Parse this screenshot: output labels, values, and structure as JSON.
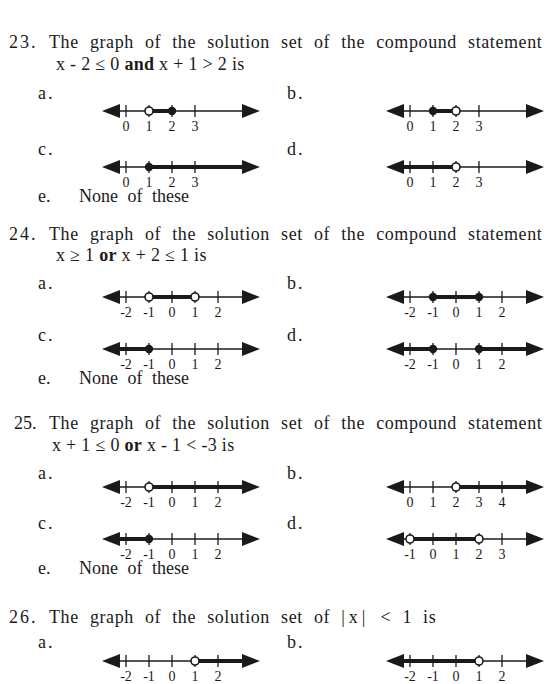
{
  "questions": [
    {
      "number": "23.",
      "line1": "The graph of the solution set of the compound statement",
      "line2_parts": [
        "x - 2 ≤ 0 ",
        "and",
        " x + 1 > 2 is"
      ],
      "options": {
        "a": {
          "label": "a.",
          "ticks": [
            "0",
            "1",
            "2",
            "3"
          ],
          "tick_values": [
            0,
            1,
            2,
            3
          ],
          "points": [
            {
              "x": 1,
              "type": "open"
            },
            {
              "x": 2,
              "type": "closed"
            }
          ],
          "shaded": [
            [
              1,
              2
            ]
          ]
        },
        "b": {
          "label": "b.",
          "ticks": [
            "0",
            "1",
            "2",
            "3"
          ],
          "tick_values": [
            0,
            1,
            2,
            3
          ],
          "points": [
            {
              "x": 1,
              "type": "closed"
            },
            {
              "x": 2,
              "type": "open"
            }
          ],
          "shaded": [
            [
              1,
              2
            ]
          ]
        },
        "c": {
          "label": "c.",
          "ticks": [
            "0",
            "1",
            "2",
            "3"
          ],
          "tick_values": [
            0,
            1,
            2,
            3
          ],
          "points": [
            {
              "x": 1,
              "type": "closed"
            }
          ],
          "shaded": [
            [
              1,
              "inf"
            ]
          ]
        },
        "d": {
          "label": "d.",
          "ticks": [
            "0",
            "1",
            "2",
            "3"
          ],
          "tick_values": [
            0,
            1,
            2,
            3
          ],
          "points": [
            {
              "x": 2,
              "type": "open"
            }
          ],
          "shaded": [
            [
              "-inf",
              2
            ]
          ]
        },
        "e": {
          "label": "e.",
          "text": "None of these"
        }
      }
    },
    {
      "number": "24.",
      "line1": "The graph of the solution set of the compound statement",
      "line2_parts": [
        "x ≥ 1 ",
        "or",
        " x + 2 ≤ 1 is"
      ],
      "options": {
        "a": {
          "label": "a.",
          "ticks": [
            "-2",
            "-1",
            "0",
            "1",
            "2"
          ],
          "tick_values": [
            -2,
            -1,
            0,
            1,
            2
          ],
          "points": [
            {
              "x": -1,
              "type": "open"
            },
            {
              "x": 1,
              "type": "open"
            }
          ],
          "shaded": [
            [
              -1,
              1
            ]
          ]
        },
        "b": {
          "label": "b.",
          "ticks": [
            "-2",
            "-1",
            "0",
            "1",
            "2"
          ],
          "tick_values": [
            -2,
            -1,
            0,
            1,
            2
          ],
          "points": [
            {
              "x": -1,
              "type": "closed"
            },
            {
              "x": 1,
              "type": "closed"
            }
          ],
          "shaded": [
            [
              -1,
              1
            ]
          ]
        },
        "c": {
          "label": "c.",
          "ticks": [
            "-2",
            "-1",
            "0",
            "1",
            "2"
          ],
          "tick_values": [
            -2,
            -1,
            0,
            1,
            2
          ],
          "points": [
            {
              "x": -1,
              "type": "closed"
            }
          ],
          "shaded": [
            [
              "-inf",
              -1
            ]
          ]
        },
        "d": {
          "label": "d.",
          "ticks": [
            "-2",
            "-1",
            "0",
            "1",
            "2"
          ],
          "tick_values": [
            -2,
            -1,
            0,
            1,
            2
          ],
          "points": [
            {
              "x": -1,
              "type": "closed"
            },
            {
              "x": 1,
              "type": "closed"
            }
          ],
          "shaded": [
            [
              "-inf",
              -1
            ],
            [
              1,
              "inf"
            ]
          ]
        },
        "e": {
          "label": "e.",
          "text": "None of these"
        }
      }
    },
    {
      "number": "25.",
      "line1": "The graph of the solution set of the compound statement",
      "line2_parts": [
        "x + 1 ≤ 0 ",
        "or",
        " x - 1 < -3 is"
      ],
      "options": {
        "a": {
          "label": "a.",
          "ticks": [
            "-2",
            "-1",
            "0",
            "1",
            "2"
          ],
          "tick_values": [
            -2,
            -1,
            0,
            1,
            2
          ],
          "points": [
            {
              "x": -1,
              "type": "open"
            }
          ],
          "shaded": [
            [
              -1,
              "inf"
            ]
          ]
        },
        "b": {
          "label": "b.",
          "ticks": [
            "0",
            "1",
            "2",
            "3",
            "4"
          ],
          "tick_values": [
            0,
            1,
            2,
            3,
            4
          ],
          "points": [
            {
              "x": 2,
              "type": "open"
            }
          ],
          "shaded": [
            [
              2,
              "inf"
            ]
          ]
        },
        "c": {
          "label": "c.",
          "ticks": [
            "-2",
            "-1",
            "0",
            "1",
            "2"
          ],
          "tick_values": [
            -2,
            -1,
            0,
            1,
            2
          ],
          "points": [
            {
              "x": -1,
              "type": "closed"
            }
          ],
          "shaded": [
            [
              "-inf",
              -1
            ]
          ]
        },
        "d": {
          "label": "d.",
          "ticks": [
            "-1",
            "0",
            "1",
            "2",
            "3"
          ],
          "tick_values": [
            -1,
            0,
            1,
            2,
            3
          ],
          "points": [
            {
              "x": -1,
              "type": "open"
            },
            {
              "x": 2,
              "type": "open"
            }
          ],
          "shaded": [
            [
              -1,
              2
            ]
          ]
        },
        "e": {
          "label": "e.",
          "text": "None of these"
        }
      }
    },
    {
      "number": "26.",
      "line1_parts": [
        "The graph of the solution set of ",
        "|x|",
        " < 1 is"
      ],
      "options": {
        "a": {
          "label": "a.",
          "ticks": [
            "-2",
            "-1",
            "0",
            "1",
            "2"
          ],
          "tick_values": [
            -2,
            -1,
            0,
            1,
            2
          ],
          "points": [
            {
              "x": 1,
              "type": "open"
            }
          ],
          "shaded": [
            [
              1,
              "inf"
            ]
          ]
        },
        "b": {
          "label": "b.",
          "ticks": [
            "-2",
            "-1",
            "0",
            "1",
            "2"
          ],
          "tick_values": [
            -2,
            -1,
            0,
            1,
            2
          ],
          "points": [
            {
              "x": 1,
              "type": "open"
            }
          ],
          "shaded": [
            [
              "-inf",
              1
            ]
          ]
        }
      }
    }
  ]
}
